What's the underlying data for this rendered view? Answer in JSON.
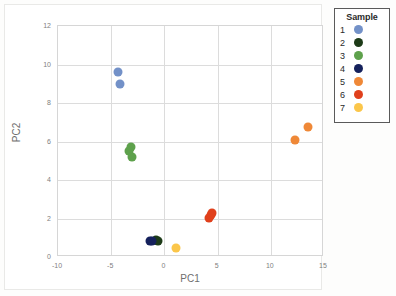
{
  "chart_data": {
    "type": "scatter",
    "title": "",
    "xlabel": "PC1",
    "ylabel": "PC2",
    "xlim": [
      -10,
      15
    ],
    "ylim": [
      0,
      12
    ],
    "xticks": [
      -10,
      -5,
      0,
      5,
      10,
      15
    ],
    "yticks": [
      0,
      2,
      4,
      6,
      8,
      10,
      12
    ],
    "grid": true,
    "legend_position": "right-outside",
    "legend_title": "Sample",
    "series": [
      {
        "name": "1",
        "color": "#7391c8",
        "points": [
          [
            -4.35,
            9.62
          ],
          [
            -4.15,
            8.97
          ]
        ]
      },
      {
        "name": "2",
        "color": "#1d3b18",
        "points": [
          [
            -0.75,
            0.88
          ],
          [
            -0.6,
            0.85
          ]
        ]
      },
      {
        "name": "3",
        "color": "#5ea14c",
        "points": [
          [
            -3.15,
            5.72
          ],
          [
            -3.3,
            5.52
          ],
          [
            -3.05,
            5.2
          ]
        ]
      },
      {
        "name": "4",
        "color": "#15215c",
        "points": [
          [
            -1.35,
            0.82
          ],
          [
            -1.15,
            0.85
          ]
        ]
      },
      {
        "name": "5",
        "color": "#ef8837",
        "points": [
          [
            12.3,
            6.08
          ],
          [
            13.5,
            6.75
          ]
        ]
      },
      {
        "name": "6",
        "color": "#e0401c",
        "points": [
          [
            4.15,
            2.05
          ],
          [
            4.35,
            2.2
          ],
          [
            4.5,
            2.3
          ]
        ]
      },
      {
        "name": "7",
        "color": "#fbc64a",
        "points": [
          [
            1.05,
            0.48
          ]
        ]
      }
    ]
  },
  "legend": {
    "title": "Sample",
    "items": [
      {
        "label": "1",
        "color": "#7391c8"
      },
      {
        "label": "2",
        "color": "#1d3b18"
      },
      {
        "label": "3",
        "color": "#5ea14c"
      },
      {
        "label": "4",
        "color": "#15215c"
      },
      {
        "label": "5",
        "color": "#ef8837"
      },
      {
        "label": "6",
        "color": "#e0401c"
      },
      {
        "label": "7",
        "color": "#fbc64a"
      }
    ]
  }
}
